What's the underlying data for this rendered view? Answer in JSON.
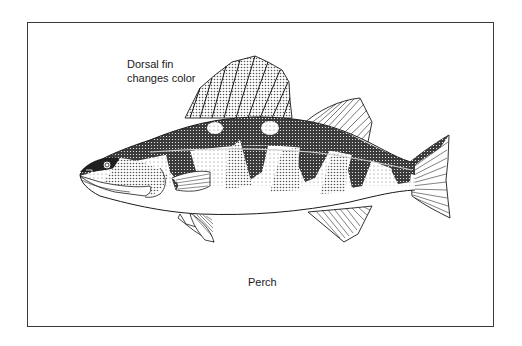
{
  "figure": {
    "caption": "Perch",
    "annotations": [
      {
        "line1": "Dorsal fin",
        "line2": "changes color",
        "target": "dorsal-fin"
      }
    ],
    "colors": {
      "ink": "#1a1a1a",
      "frame": "#3a3a3a",
      "background": "#ffffff",
      "stipple_dark": "#2a2a2a",
      "stipple_light": "#9a9a9a"
    }
  }
}
